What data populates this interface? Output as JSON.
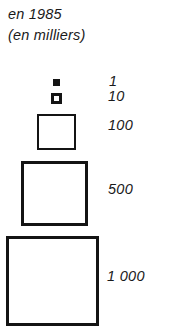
{
  "figure": {
    "kind": "proportional-symbol-legend",
    "heading": {
      "year_line": "en 1985",
      "units_line": "(en milliers)"
    },
    "colors": {
      "ink": "#141414",
      "paper": "#ffffff",
      "text": "#1a1a1a"
    }
  },
  "chart_data": {
    "type": "legend",
    "title": "en 1985",
    "subtitle": "(en milliers)",
    "xlabel": "",
    "ylabel": "",
    "grid": false,
    "legend_position": "right",
    "symbol_shape": "square",
    "units": "milliers",
    "categories": [
      "1",
      "10",
      "100",
      "500",
      "1 000"
    ],
    "values": [
      1,
      10,
      100,
      500,
      1000
    ],
    "entries": [
      {
        "label": "1",
        "value": 1,
        "symbol": "filled-square",
        "size_px": 7,
        "fill": "#141414",
        "stroke": "#141414"
      },
      {
        "label": "10",
        "value": 10,
        "symbol": "square",
        "size_px": 11,
        "fill": "#ffffff",
        "stroke": "#141414"
      },
      {
        "label": "100",
        "value": 100,
        "symbol": "square",
        "size_px": 39,
        "fill": "#ffffff",
        "stroke": "#141414"
      },
      {
        "label": "500",
        "value": 500,
        "symbol": "square",
        "size_px": 67,
        "fill": "#ffffff",
        "stroke": "#141414"
      },
      {
        "label": "1 000",
        "value": 1000,
        "symbol": "square",
        "size_px": 93,
        "fill": "#ffffff",
        "stroke": "#141414"
      }
    ]
  }
}
